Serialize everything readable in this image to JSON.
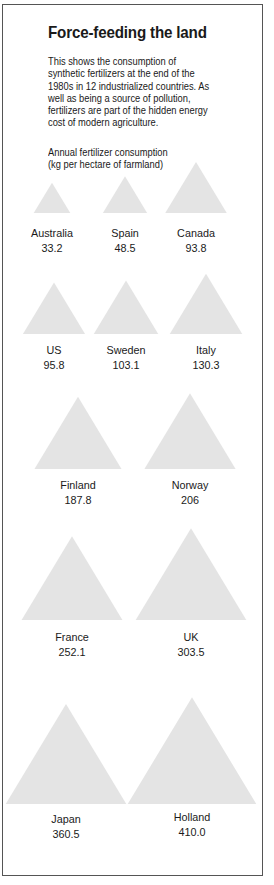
{
  "title": "Force-feeding the land",
  "description_lines": [
    "This  shows the consumption of",
    "synthetic fertilizers at the end of the",
    "1980s in 12 industrialized countries. As",
    "well as being a source of pollution,",
    "fertilizers are part of the hidden energy",
    "cost of modern agriculture."
  ],
  "unit_lines": [
    "Annual fertilizer consumption",
    "(kg per hectare of farmland)"
  ],
  "colors": {
    "triangle_fill": "#e4e4e4",
    "border": "#555555",
    "text": "#1a1a1a"
  },
  "chart_data": {
    "type": "bar",
    "mark": "triangle",
    "title": "Force-feeding the land",
    "ylabel": "Annual fertilizer consumption (kg per hectare of farmland)",
    "categories": [
      "Australia",
      "Spain",
      "Canada",
      "US",
      "Sweden",
      "Italy",
      "Finland",
      "Norway",
      "France",
      "UK",
      "Japan",
      "Holland"
    ],
    "values": [
      33.2,
      48.5,
      93.8,
      95.8,
      103.1,
      130.3,
      187.8,
      206,
      252.1,
      303.5,
      360.5,
      410.0
    ],
    "value_labels": [
      "33.2",
      "48.5",
      "93.8",
      "95.8",
      "103.1",
      "130.3",
      "187.8",
      "206",
      "252.1",
      "303.5",
      "360.5",
      "410.0"
    ],
    "legend": "none",
    "grid": false
  }
}
